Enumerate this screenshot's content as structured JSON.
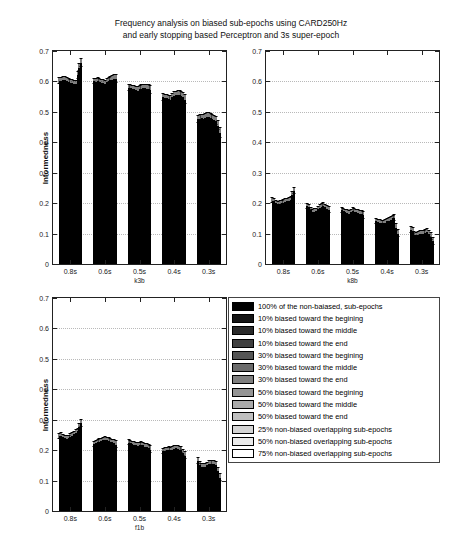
{
  "figure": {
    "title_line1": "Frequency analysis on biased sub-epochs using CARD250Hz",
    "title_line2": "and early stopping based Perceptron and 3s super-epoch",
    "background": "#ffffff",
    "bar_edge_color": "#000000"
  },
  "legend": {
    "position": "center-right",
    "entries": [
      {
        "label": "100% of the non-baiased, sub-epochs",
        "color": "#000000"
      },
      {
        "label": "10% biased toward the begining",
        "color": "#151515"
      },
      {
        "label": "10% biased toward the middle",
        "color": "#2a2a2a"
      },
      {
        "label": "10% biased toward the end",
        "color": "#3f3f3f"
      },
      {
        "label": "30% biased toward the begining",
        "color": "#555555"
      },
      {
        "label": "30% biased toward the middle",
        "color": "#6a6a6a"
      },
      {
        "label": "30% biased toward the end",
        "color": "#7f7f7f"
      },
      {
        "label": "50% biased toward the begining",
        "color": "#949494"
      },
      {
        "label": "50% biased toward the middle",
        "color": "#aaaaaa"
      },
      {
        "label": "50% biased toward the end",
        "color": "#bfbfbf"
      },
      {
        "label": "25% non-biased overlapping sub-epochs",
        "color": "#d4d4d4"
      },
      {
        "label": "50% non-biased overlapping sub-epochs",
        "color": "#eaeaea"
      },
      {
        "label": "75% non-biased overlapping sub-epochs",
        "color": "#ffffff"
      }
    ]
  },
  "chart_data": [
    {
      "id": "k3b",
      "type": "bar",
      "title": "",
      "xlabel": "k3b",
      "ylabel": "Informedness",
      "ylim": [
        0,
        0.7
      ],
      "yticks": [
        0,
        0.1,
        0.2,
        0.3,
        0.4,
        0.5,
        0.6,
        0.7
      ],
      "ytick_labels": [
        "0",
        "0.1",
        "0.2",
        "0.3",
        "0.4",
        "0.5",
        "0.6",
        "0.7"
      ],
      "grid": true,
      "categories": [
        "0.8s",
        "0.6s",
        "0.5s",
        "0.4s",
        "0.3s"
      ],
      "series": [
        {
          "name": "100% of the non-baiased, sub-epochs",
          "values": [
            0.601,
            0.6,
            0.577,
            0.548,
            0.476
          ]
        },
        {
          "name": "10% biased toward the begining",
          "values": [
            0.603,
            0.598,
            0.578,
            0.546,
            0.478
          ]
        },
        {
          "name": "10% biased toward the middle",
          "values": [
            0.605,
            0.601,
            0.576,
            0.544,
            0.479
          ]
        },
        {
          "name": "10% biased toward the end",
          "values": [
            0.604,
            0.599,
            0.574,
            0.542,
            0.477
          ]
        },
        {
          "name": "30% biased toward the begining",
          "values": [
            0.6,
            0.596,
            0.572,
            0.54,
            0.48
          ]
        },
        {
          "name": "30% biased toward the middle",
          "values": [
            0.598,
            0.594,
            0.57,
            0.548,
            0.482
          ]
        },
        {
          "name": "30% biased toward the end",
          "values": [
            0.596,
            0.592,
            0.574,
            0.552,
            0.484
          ]
        },
        {
          "name": "50% biased toward the begining",
          "values": [
            0.594,
            0.598,
            0.576,
            0.554,
            0.481
          ]
        },
        {
          "name": "50% biased toward the middle",
          "values": [
            0.592,
            0.601,
            0.578,
            0.556,
            0.478
          ]
        },
        {
          "name": "50% biased toward the end",
          "values": [
            0.59,
            0.604,
            0.577,
            0.555,
            0.474
          ]
        },
        {
          "name": "25% non-biased overlapping sub-epochs",
          "values": [
            0.62,
            0.606,
            0.576,
            0.552,
            0.47
          ]
        },
        {
          "name": "50% non-biased overlapping sub-epochs",
          "values": [
            0.645,
            0.608,
            0.575,
            0.548,
            0.455
          ]
        },
        {
          "name": "75% non-biased overlapping sub-epochs",
          "values": [
            0.66,
            0.607,
            0.573,
            0.54,
            0.43
          ]
        }
      ],
      "errors": [
        [
          0.01,
          0.009,
          0.01,
          0.011,
          0.012
        ],
        [
          0.009,
          0.009,
          0.01,
          0.011,
          0.012
        ],
        [
          0.009,
          0.009,
          0.01,
          0.011,
          0.012
        ],
        [
          0.01,
          0.01,
          0.01,
          0.011,
          0.012
        ],
        [
          0.01,
          0.01,
          0.011,
          0.012,
          0.012
        ],
        [
          0.01,
          0.01,
          0.011,
          0.012,
          0.013
        ],
        [
          0.01,
          0.01,
          0.011,
          0.012,
          0.013
        ],
        [
          0.01,
          0.01,
          0.011,
          0.012,
          0.013
        ],
        [
          0.01,
          0.01,
          0.011,
          0.012,
          0.013
        ],
        [
          0.011,
          0.011,
          0.011,
          0.012,
          0.013
        ],
        [
          0.011,
          0.011,
          0.011,
          0.012,
          0.014
        ],
        [
          0.012,
          0.012,
          0.012,
          0.013,
          0.015
        ],
        [
          0.013,
          0.013,
          0.013,
          0.014,
          0.016
        ]
      ]
    },
    {
      "id": "k8b",
      "type": "bar",
      "title": "",
      "xlabel": "k8b",
      "ylabel": "",
      "ylim": [
        0,
        0.7
      ],
      "yticks": [
        0,
        0.1,
        0.2,
        0.3,
        0.4,
        0.5,
        0.6,
        0.7
      ],
      "ytick_labels": [
        "0",
        "0.1",
        "0.2",
        "0.3",
        "0.4",
        "0.5",
        "0.6",
        "0.7"
      ],
      "grid": true,
      "categories": [
        "0.8s",
        "0.6s",
        "0.5s",
        "0.4s",
        "0.3s"
      ],
      "series": [
        {
          "name": "100% of the non-baiased, sub-epochs",
          "values": [
            0.208,
            0.19,
            0.176,
            0.14,
            0.112
          ]
        },
        {
          "name": "10% biased toward the begining",
          "values": [
            0.206,
            0.186,
            0.174,
            0.138,
            0.108
          ]
        },
        {
          "name": "10% biased toward the middle",
          "values": [
            0.2,
            0.176,
            0.17,
            0.136,
            0.096
          ]
        },
        {
          "name": "10% biased toward the end",
          "values": [
            0.196,
            0.17,
            0.168,
            0.134,
            0.094
          ]
        },
        {
          "name": "30% biased toward the begining",
          "values": [
            0.198,
            0.172,
            0.166,
            0.134,
            0.096
          ]
        },
        {
          "name": "30% biased toward the middle",
          "values": [
            0.2,
            0.174,
            0.17,
            0.136,
            0.098
          ]
        },
        {
          "name": "30% biased toward the end",
          "values": [
            0.202,
            0.18,
            0.174,
            0.14,
            0.1
          ]
        },
        {
          "name": "50% biased toward the begining",
          "values": [
            0.204,
            0.184,
            0.172,
            0.142,
            0.1
          ]
        },
        {
          "name": "50% biased toward the middle",
          "values": [
            0.206,
            0.188,
            0.17,
            0.146,
            0.102
          ]
        },
        {
          "name": "50% biased toward the end",
          "values": [
            0.208,
            0.19,
            0.168,
            0.15,
            0.104
          ]
        },
        {
          "name": "25% non-biased overlapping sub-epochs",
          "values": [
            0.212,
            0.186,
            0.166,
            0.152,
            0.1
          ]
        },
        {
          "name": "50% non-biased overlapping sub-epochs",
          "values": [
            0.228,
            0.182,
            0.164,
            0.12,
            0.09
          ]
        },
        {
          "name": "75% non-biased overlapping sub-epochs",
          "values": [
            0.24,
            0.178,
            0.16,
            0.1,
            0.074
          ]
        }
      ],
      "errors": [
        [
          0.008,
          0.008,
          0.008,
          0.008,
          0.009
        ],
        [
          0.008,
          0.008,
          0.008,
          0.008,
          0.009
        ],
        [
          0.008,
          0.008,
          0.008,
          0.008,
          0.009
        ],
        [
          0.008,
          0.008,
          0.008,
          0.008,
          0.009
        ],
        [
          0.008,
          0.008,
          0.008,
          0.008,
          0.009
        ],
        [
          0.008,
          0.008,
          0.008,
          0.008,
          0.009
        ],
        [
          0.008,
          0.009,
          0.009,
          0.009,
          0.009
        ],
        [
          0.009,
          0.009,
          0.009,
          0.009,
          0.01
        ],
        [
          0.009,
          0.009,
          0.009,
          0.009,
          0.01
        ],
        [
          0.009,
          0.009,
          0.009,
          0.009,
          0.01
        ],
        [
          0.009,
          0.009,
          0.009,
          0.01,
          0.01
        ],
        [
          0.01,
          0.01,
          0.01,
          0.01,
          0.011
        ],
        [
          0.011,
          0.011,
          0.011,
          0.011,
          0.012
        ]
      ]
    },
    {
      "id": "f1b",
      "type": "bar",
      "title": "",
      "xlabel": "f1b",
      "ylabel": "Informedness",
      "ylim": [
        0,
        0.7
      ],
      "yticks": [
        0,
        0.1,
        0.2,
        0.3,
        0.4,
        0.5,
        0.6,
        0.7
      ],
      "ytick_labels": [
        "0",
        "0.1",
        "0.2",
        "0.3",
        "0.4",
        "0.5",
        "0.6",
        "0.7"
      ],
      "grid": true,
      "categories": [
        "0.8s",
        "0.6s",
        "0.5s",
        "0.4s",
        "0.3s"
      ],
      "series": [
        {
          "name": "100% of the non-baiased, sub-epochs",
          "values": [
            0.245,
            0.22,
            0.224,
            0.196,
            0.164
          ]
        },
        {
          "name": "10% biased toward the begining",
          "values": [
            0.247,
            0.222,
            0.222,
            0.198,
            0.152
          ]
        },
        {
          "name": "10% biased toward the middle",
          "values": [
            0.243,
            0.226,
            0.22,
            0.2,
            0.146
          ]
        },
        {
          "name": "10% biased toward the end",
          "values": [
            0.24,
            0.228,
            0.218,
            0.202,
            0.144
          ]
        },
        {
          "name": "30% biased toward the begining",
          "values": [
            0.238,
            0.23,
            0.216,
            0.2,
            0.146
          ]
        },
        {
          "name": "30% biased toward the middle",
          "values": [
            0.24,
            0.232,
            0.214,
            0.202,
            0.15
          ]
        },
        {
          "name": "30% biased toward the end",
          "values": [
            0.244,
            0.234,
            0.216,
            0.204,
            0.154
          ]
        },
        {
          "name": "50% biased toward the begining",
          "values": [
            0.248,
            0.232,
            0.218,
            0.206,
            0.156
          ]
        },
        {
          "name": "50% biased toward the middle",
          "values": [
            0.252,
            0.23,
            0.216,
            0.204,
            0.156
          ]
        },
        {
          "name": "50% biased toward the end",
          "values": [
            0.256,
            0.228,
            0.212,
            0.202,
            0.154
          ]
        },
        {
          "name": "25% non-biased overlapping sub-epochs",
          "values": [
            0.262,
            0.226,
            0.21,
            0.2,
            0.15
          ]
        },
        {
          "name": "50% non-biased overlapping sub-epochs",
          "values": [
            0.275,
            0.222,
            0.206,
            0.192,
            0.132
          ]
        },
        {
          "name": "75% non-biased overlapping sub-epochs",
          "values": [
            0.288,
            0.218,
            0.202,
            0.182,
            0.11
          ]
        }
      ],
      "errors": [
        [
          0.008,
          0.008,
          0.008,
          0.008,
          0.009
        ],
        [
          0.008,
          0.008,
          0.008,
          0.008,
          0.009
        ],
        [
          0.008,
          0.008,
          0.008,
          0.008,
          0.009
        ],
        [
          0.008,
          0.008,
          0.008,
          0.008,
          0.009
        ],
        [
          0.008,
          0.008,
          0.008,
          0.008,
          0.009
        ],
        [
          0.008,
          0.008,
          0.009,
          0.009,
          0.009
        ],
        [
          0.009,
          0.009,
          0.009,
          0.009,
          0.01
        ],
        [
          0.009,
          0.009,
          0.009,
          0.009,
          0.01
        ],
        [
          0.009,
          0.009,
          0.009,
          0.009,
          0.01
        ],
        [
          0.009,
          0.009,
          0.009,
          0.009,
          0.01
        ],
        [
          0.009,
          0.009,
          0.01,
          0.01,
          0.01
        ],
        [
          0.01,
          0.01,
          0.01,
          0.01,
          0.011
        ],
        [
          0.011,
          0.011,
          0.011,
          0.011,
          0.012
        ]
      ]
    }
  ]
}
